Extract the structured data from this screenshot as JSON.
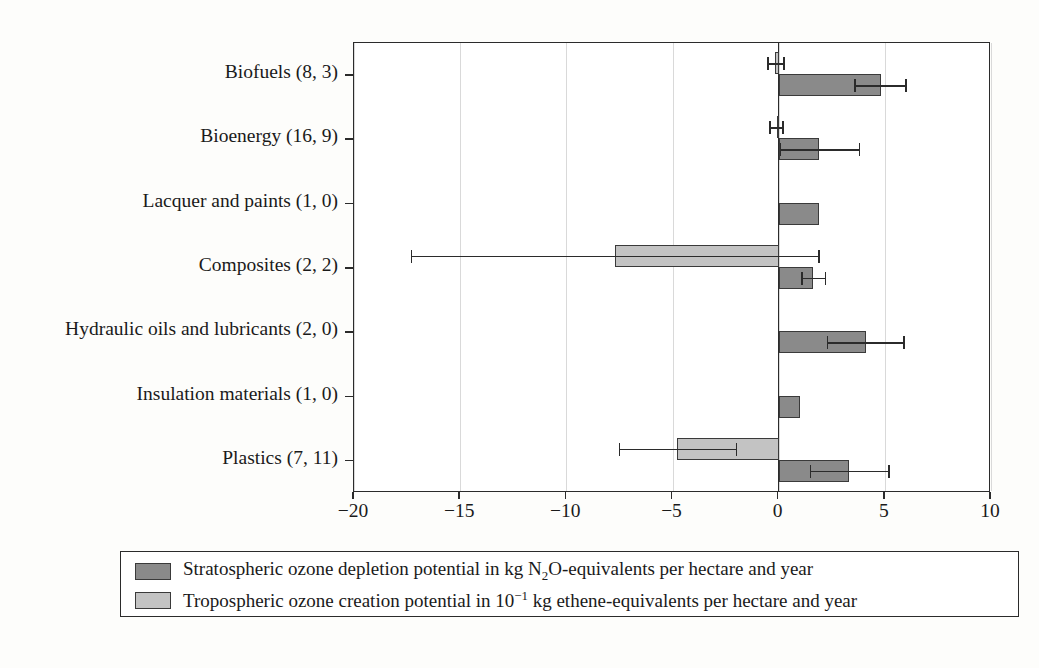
{
  "chart_data": {
    "type": "bar",
    "orientation": "horizontal",
    "title": "",
    "xlabel": "",
    "ylabel": "",
    "xlim": [
      -20,
      10
    ],
    "xticks": [
      -20,
      -15,
      -10,
      -5,
      0,
      5,
      10
    ],
    "xtick_labels": [
      "−20",
      "−15",
      "−10",
      "−5",
      "0",
      "5",
      "10"
    ],
    "grid": "vertical gridlines at each x tick",
    "zero_reference_line": 0,
    "legend_position": "below plot, boxed, two rows",
    "categories": [
      "Biofuels (8, 3)",
      "Bioenergy (16, 9)",
      "Lacquer and paints (1, 0)",
      "Composites (2, 2)",
      "Hydraulic oils and lubricants (2, 0)",
      "Insulation materials (1, 0)",
      "Plastics (7, 11)"
    ],
    "series": [
      {
        "name": "Stratospheric ozone depletion potential in kg N2O-equivalents per hectare and year",
        "color": "#8a8a8a",
        "values": [
          4.8,
          1.9,
          1.9,
          1.6,
          4.1,
          1.0,
          3.3
        ],
        "err_low": [
          3.6,
          0.1,
          null,
          1.1,
          2.3,
          null,
          1.5
        ],
        "err_high": [
          6.0,
          3.8,
          null,
          2.2,
          5.9,
          null,
          5.2
        ]
      },
      {
        "name": "Tropospheric ozone creation potential in 10^-1 kg ethene-equivalents per hectare and year",
        "color": "#c3c3c3",
        "values": [
          -0.15,
          -0.1,
          null,
          -7.7,
          null,
          null,
          -4.8
        ],
        "err_low": [
          -0.5,
          -0.4,
          null,
          -17.3,
          null,
          null,
          -7.5
        ],
        "err_high": [
          0.25,
          0.2,
          null,
          1.9,
          null,
          null,
          -2.0
        ]
      }
    ]
  },
  "legend": {
    "rows": [
      {
        "swatch": "dark",
        "text_prefix": "Stratospheric ozone depletion potential in kg N",
        "text_sub": "2",
        "text_suffix": "O-equivalents per hectare and year"
      },
      {
        "swatch": "light",
        "text_prefix": "Tropospheric ozone creation potential in 10",
        "text_sup": "−1",
        "text_suffix": " kg ethene-equivalents per hectare and year"
      }
    ]
  }
}
